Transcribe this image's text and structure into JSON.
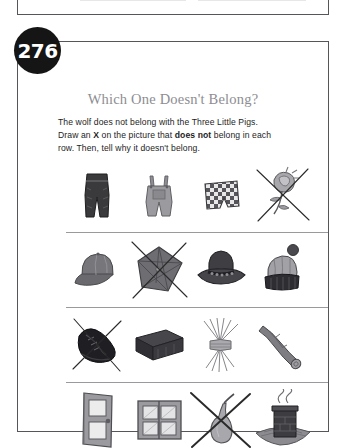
{
  "page": {
    "number": "276",
    "title": "Which One Doesn't Belong?",
    "instructions": {
      "line1": "The wolf does not belong with the Three Little Pigs.",
      "line2_pre": "Draw an ",
      "line2_x": "X",
      "line2_mid": " on the picture that ",
      "line2_bold": "does not",
      "line2_post": " belong in each",
      "line3": "row. Then, tell why it doesn't belong."
    }
  },
  "colors": {
    "badge_bg": "#151515",
    "badge_text": "#ffffff",
    "title_gray": "#8d8d92",
    "frame": "#56565a",
    "divider": "#9a9a9e",
    "ink": "#1d1d1d"
  },
  "rows": [
    {
      "id": "row-1-clothing",
      "items": [
        {
          "name": "pants",
          "label": "dark pants",
          "marked": false
        },
        {
          "name": "overalls",
          "label": "overalls",
          "marked": false
        },
        {
          "name": "checkered-shorts",
          "label": "checkered shorts",
          "marked": false
        },
        {
          "name": "rose",
          "label": "rose flower",
          "marked": true,
          "mark_style": "thin"
        }
      ]
    },
    {
      "id": "row-2-headwear",
      "items": [
        {
          "name": "baseball-cap",
          "label": "baseball cap",
          "marked": false
        },
        {
          "name": "umbrella",
          "label": "umbrella",
          "marked": true,
          "mark_style": "thin"
        },
        {
          "name": "cowboy-hat",
          "label": "cowboy hat",
          "marked": false
        },
        {
          "name": "winter-beanie",
          "label": "winter beanie hat",
          "marked": false
        }
      ]
    },
    {
      "id": "row-3-building-materials",
      "items": [
        {
          "name": "shoe",
          "label": "shoe",
          "marked": true,
          "mark_style": "thin"
        },
        {
          "name": "brick",
          "label": "brick",
          "marked": false
        },
        {
          "name": "straw-bundle",
          "label": "bundle of straw",
          "marked": false
        },
        {
          "name": "wooden-log",
          "label": "wooden log",
          "marked": false
        }
      ]
    },
    {
      "id": "row-4-house-parts",
      "items": [
        {
          "name": "door",
          "label": "door",
          "marked": false
        },
        {
          "name": "window",
          "label": "window",
          "marked": false
        },
        {
          "name": "pear",
          "label": "pear",
          "marked": true,
          "mark_style": "bold"
        },
        {
          "name": "chimney",
          "label": "chimney on roof",
          "marked": false
        }
      ]
    }
  ]
}
